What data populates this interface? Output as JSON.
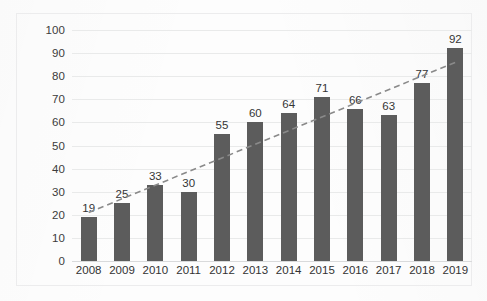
{
  "chart_data": {
    "type": "bar",
    "title": "",
    "subtitle": "",
    "xlabel": "",
    "ylabel": "",
    "categories": [
      "2008",
      "2009",
      "2010",
      "2011",
      "2012",
      "2013",
      "2014",
      "2015",
      "2016",
      "2017",
      "2018",
      "2019"
    ],
    "values": [
      19,
      25,
      33,
      30,
      55,
      60,
      64,
      71,
      66,
      63,
      77,
      92
    ],
    "series": [
      {
        "name": "bars",
        "values": [
          19,
          25,
          33,
          30,
          55,
          60,
          64,
          71,
          66,
          63,
          77,
          92
        ],
        "color": "#5c5c5c"
      },
      {
        "name": "trendline",
        "type": "linear-trendline",
        "style": "dashed",
        "color": "#8a8a8a",
        "start": {
          "x": "2008",
          "y": 21
        },
        "end": {
          "x": "2019",
          "y": 86
        }
      }
    ],
    "ylim": [
      0,
      100
    ],
    "ytick_step": 10,
    "ytick_labels": [
      "0",
      "10",
      "20",
      "30",
      "40",
      "50",
      "60",
      "70",
      "80",
      "90",
      "100"
    ],
    "grid": "horizontal",
    "legend": "none",
    "data_labels": true
  },
  "axis": {
    "y_ticks": [
      {
        "label": "100",
        "value": 100
      },
      {
        "label": "90",
        "value": 90
      },
      {
        "label": "80",
        "value": 80
      },
      {
        "label": "70",
        "value": 70
      },
      {
        "label": "60",
        "value": 60
      },
      {
        "label": "50",
        "value": 50
      },
      {
        "label": "40",
        "value": 40
      },
      {
        "label": "30",
        "value": 30
      },
      {
        "label": "20",
        "value": 20
      },
      {
        "label": "10",
        "value": 10
      },
      {
        "label": "0",
        "value": 0
      }
    ],
    "x_ticks": [
      {
        "label": "2008"
      },
      {
        "label": "2009"
      },
      {
        "label": "2010"
      },
      {
        "label": "2011"
      },
      {
        "label": "2012"
      },
      {
        "label": "2013"
      },
      {
        "label": "2014"
      },
      {
        "label": "2015"
      },
      {
        "label": "2016"
      },
      {
        "label": "2017"
      },
      {
        "label": "2018"
      },
      {
        "label": "2019"
      }
    ]
  },
  "bars": [
    {
      "category": "2008",
      "value": 19,
      "label": "19"
    },
    {
      "category": "2009",
      "value": 25,
      "label": "25"
    },
    {
      "category": "2010",
      "value": 33,
      "label": "33"
    },
    {
      "category": "2011",
      "value": 30,
      "label": "30"
    },
    {
      "category": "2012",
      "value": 55,
      "label": "55"
    },
    {
      "category": "2013",
      "value": 60,
      "label": "60"
    },
    {
      "category": "2014",
      "value": 64,
      "label": "64"
    },
    {
      "category": "2015",
      "value": 71,
      "label": "71"
    },
    {
      "category": "2016",
      "value": 66,
      "label": "66"
    },
    {
      "category": "2017",
      "value": 63,
      "label": "63"
    },
    {
      "category": "2018",
      "value": 77,
      "label": "77"
    },
    {
      "category": "2019",
      "value": 92,
      "label": "92"
    }
  ],
  "colors": {
    "bar": "#5c5c5c",
    "trendline": "#8a8a8a",
    "gridline": "#e9eaea",
    "border": "#ececed",
    "text": "#333333",
    "background": "#ffffff"
  }
}
